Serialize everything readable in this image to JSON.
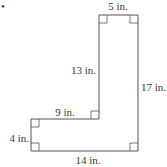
{
  "diagram": {
    "shape": "L-shaped polygon",
    "stroke_color": "#555555",
    "marker": "•",
    "labels": {
      "top": "5 in.",
      "inner_vertical": "13 in.",
      "right": "17 in.",
      "inner_horizontal": "9 in.",
      "left": "4 in.",
      "bottom": "14 in."
    },
    "right_angle_markers": 6
  }
}
